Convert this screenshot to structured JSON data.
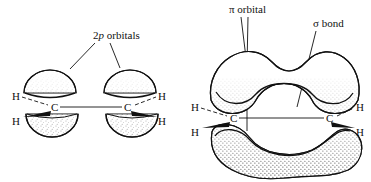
{
  "figure": {
    "title_visible": false,
    "background_color": "#ffffff",
    "ink_color": "#111111",
    "panels": [
      {
        "id": "left-panel",
        "description": "two carbon atoms with four separate unmerged 2p orbital lobes",
        "labels": [
          {
            "name": "2p-orbitals-label",
            "text_prefix": "2",
            "text_italic": "p",
            "text_suffix": " orbitals",
            "full_text": "2p orbitals"
          }
        ],
        "atoms": [
          {
            "name": "carbon-left",
            "symbol": "C"
          },
          {
            "name": "carbon-right",
            "symbol": "C"
          },
          {
            "name": "hydrogen-upper-left",
            "symbol": "H",
            "bond": "dashed"
          },
          {
            "name": "hydrogen-lower-left",
            "symbol": "H",
            "bond": "wedge"
          },
          {
            "name": "hydrogen-upper-right",
            "symbol": "H",
            "bond": "dashed"
          },
          {
            "name": "hydrogen-lower-right",
            "symbol": "H",
            "bond": "wedge"
          }
        ],
        "orbitals": [
          {
            "name": "p-lobe-upper-left",
            "shape": "dome-up"
          },
          {
            "name": "p-lobe-upper-right",
            "shape": "dome-up"
          },
          {
            "name": "p-lobe-lower-left",
            "shape": "dome-down"
          },
          {
            "name": "p-lobe-lower-right",
            "shape": "dome-down"
          }
        ]
      },
      {
        "id": "right-panel",
        "description": "two carbon atoms with merged pi orbital clouds above and below the sigma bond",
        "labels": [
          {
            "name": "pi-orbital-label",
            "full_text": "π orbital",
            "symbol": "π",
            "word": " orbital"
          },
          {
            "name": "sigma-bond-label",
            "full_text": "σ bond",
            "symbol": "σ",
            "word": " bond"
          }
        ],
        "atoms": [
          {
            "name": "carbon-left",
            "symbol": "C"
          },
          {
            "name": "carbon-right",
            "symbol": "C"
          },
          {
            "name": "hydrogen-upper-left",
            "symbol": "H",
            "bond": "dashed"
          },
          {
            "name": "hydrogen-lower-left",
            "symbol": "H",
            "bond": "wedge"
          },
          {
            "name": "hydrogen-upper-right",
            "symbol": "H",
            "bond": "dashed"
          },
          {
            "name": "hydrogen-lower-right",
            "symbol": "H",
            "bond": "wedge"
          }
        ],
        "orbitals": [
          {
            "name": "pi-cloud-upper",
            "shape": "saddle-lobe-up"
          },
          {
            "name": "pi-cloud-lower",
            "shape": "kidney-lobe-down"
          }
        ]
      }
    ]
  }
}
